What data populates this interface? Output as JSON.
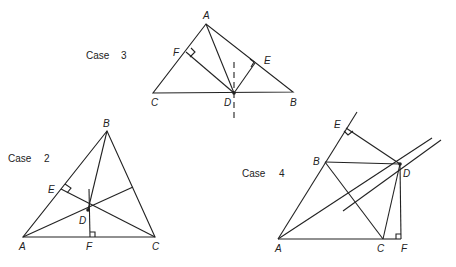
{
  "figures": [
    {
      "id": "case3",
      "title": "Case",
      "number": "3",
      "labels": {
        "A": "A",
        "B": "B",
        "C": "C",
        "D": "D",
        "E": "E",
        "F": "F"
      }
    },
    {
      "id": "case2",
      "title": "Case",
      "number": "2",
      "labels": {
        "A": "A",
        "B": "B",
        "C": "C",
        "D": "D",
        "E": "E",
        "F": "F"
      }
    },
    {
      "id": "case4",
      "title": "Case",
      "number": "4",
      "labels": {
        "A": "A",
        "B": "B",
        "C": "C",
        "D": "D",
        "E": "E",
        "F": "F"
      }
    }
  ],
  "colors": {
    "stroke": "#222222",
    "background": "#ffffff"
  }
}
